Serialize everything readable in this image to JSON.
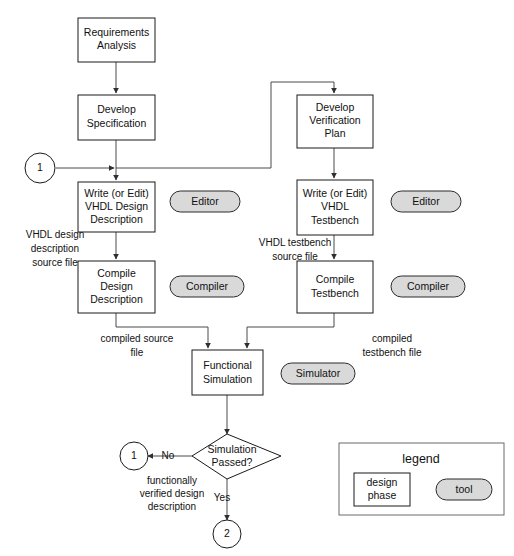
{
  "diagram": {
    "colors": {
      "box_fill": "#ffffff",
      "box_stroke": "#1a1a1a",
      "tool_fill": "#d9d9d9",
      "tool_stroke": "#2b2b2b",
      "connector": "#4a4a4a",
      "legend_stroke": "#6b6b6b",
      "text": "#111111"
    },
    "process_boxes": [
      {
        "id": "requirements-analysis",
        "lines": [
          "Requirements",
          "Analysis"
        ]
      },
      {
        "id": "develop-specification",
        "lines": [
          "Develop",
          "Specification"
        ]
      },
      {
        "id": "write-vhdl-design-description",
        "lines": [
          "Write (or Edit)",
          "VHDL Design",
          "Description"
        ]
      },
      {
        "id": "compile-design-description",
        "lines": [
          "Compile",
          "Design",
          "Description"
        ]
      },
      {
        "id": "develop-verification-plan",
        "lines": [
          "Develop",
          "Verification",
          "Plan"
        ]
      },
      {
        "id": "write-vhdl-testbench",
        "lines": [
          "Write (or Edit)",
          "VHDL",
          "Testbench"
        ]
      },
      {
        "id": "compile-testbench",
        "lines": [
          "Compile",
          "Testbench"
        ]
      },
      {
        "id": "functional-simulation",
        "lines": [
          "Functional",
          "Simulation"
        ]
      }
    ],
    "tool_pills": [
      {
        "id": "editor-design",
        "label": "Editor"
      },
      {
        "id": "editor-testbench",
        "label": "Editor"
      },
      {
        "id": "compiler-design",
        "label": "Compiler"
      },
      {
        "id": "compiler-testbench",
        "label": "Compiler"
      },
      {
        "id": "simulator",
        "label": "Simulator"
      }
    ],
    "decision": {
      "id": "simulation-passed",
      "lines": [
        "Simulation",
        "Passed?"
      ],
      "branch_no": "No",
      "branch_yes": "Yes"
    },
    "connectors": [
      {
        "id": "connector-1-left",
        "label": "1"
      },
      {
        "id": "connector-1-no",
        "label": "1"
      },
      {
        "id": "connector-2-yes",
        "label": "2"
      }
    ],
    "edge_labels": [
      {
        "id": "vhdl-design-source-file",
        "lines": [
          "VHDL design",
          "description",
          "source file"
        ]
      },
      {
        "id": "vhdl-testbench-source-file",
        "lines": [
          "VHDL testbench",
          "source file"
        ]
      },
      {
        "id": "compiled-source-file",
        "lines": [
          "compiled source",
          "file"
        ]
      },
      {
        "id": "compiled-testbench-file",
        "lines": [
          "compiled",
          "testbench file"
        ]
      },
      {
        "id": "functionally-verified",
        "lines": [
          "functionally",
          "verified design",
          "description"
        ]
      }
    ],
    "legend": {
      "title": "legend",
      "design_phase_lines": [
        "design",
        "phase"
      ],
      "tool_label": "tool"
    }
  }
}
